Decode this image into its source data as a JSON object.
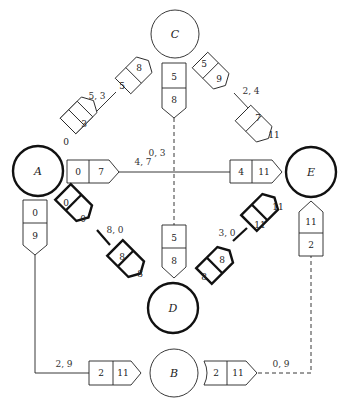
{
  "diagram": {
    "type": "network-precedence-diagram",
    "nodes": [
      {
        "id": "A",
        "label": "A",
        "critical": true
      },
      {
        "id": "B",
        "label": "B",
        "critical": false
      },
      {
        "id": "C",
        "label": "C",
        "critical": false
      },
      {
        "id": "D",
        "label": "D",
        "critical": true
      },
      {
        "id": "E",
        "label": "E",
        "critical": true
      }
    ],
    "edges": [
      {
        "from": "A",
        "to": "C",
        "label": "5, 3",
        "tail": [
          "0",
          "3"
        ],
        "head": [
          "5",
          "8"
        ],
        "critical": false,
        "dashed": false
      },
      {
        "from": "A",
        "to": "E",
        "label": "4, 7",
        "tail": [
          "0",
          "7"
        ],
        "head": [
          "4",
          "11"
        ],
        "critical": false,
        "dashed": false
      },
      {
        "from": "A",
        "to": "D",
        "label": "8, 0",
        "tail": [
          "0",
          "0"
        ],
        "head": [
          "8",
          "8"
        ],
        "critical": true,
        "dashed": false
      },
      {
        "from": "A",
        "to": "B",
        "label": "2, 9",
        "tail": [
          "0",
          "9"
        ],
        "head": [
          "2",
          "11"
        ],
        "critical": false,
        "dashed": false
      },
      {
        "from": "C",
        "to": "D",
        "label": "0, 3",
        "tail": [
          "5",
          "8"
        ],
        "head": [
          "5",
          "8"
        ],
        "critical": false,
        "dashed": true
      },
      {
        "from": "C",
        "to": "E",
        "label": "2, 4",
        "tail": [
          "5",
          "9"
        ],
        "head": [
          "7",
          "11"
        ],
        "critical": false,
        "dashed": false
      },
      {
        "from": "D",
        "to": "E",
        "label": "3, 0",
        "tail": [
          "8",
          "8"
        ],
        "head": [
          "11",
          "11"
        ],
        "critical": true,
        "dashed": false
      },
      {
        "from": "B",
        "to": "E",
        "label": "0, 9",
        "tail": [
          "2",
          "11"
        ],
        "head": [
          "11",
          "2"
        ],
        "critical": false,
        "dashed": true
      }
    ]
  }
}
